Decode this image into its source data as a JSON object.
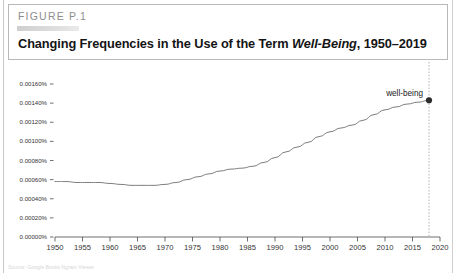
{
  "figure": {
    "number_label": "FIGURE P.1",
    "title_prefix": "Changing Frequencies in the Use of the Term ",
    "title_term": "Well-Being",
    "title_suffix": ", 1950–2019",
    "redaction_present": true
  },
  "source_note": "Source: Google Books Ngram Viewer",
  "colors": {
    "line": "#6e6e6e",
    "marker": "#2b2b2b",
    "axis": "#4a4a4a",
    "tick_text": "#333333",
    "guide_line": "#9a9a9a",
    "header_border": "#b9b9b9",
    "figure_number_text": "#8d8d8d"
  },
  "chart_data": {
    "type": "line",
    "title": "Changing Frequencies in the Use of the Term Well-Being, 1950–2019",
    "xlabel": "",
    "ylabel": "",
    "xlim": [
      1950,
      2020
    ],
    "ylim": [
      0.0,
      0.0016
    ],
    "grid": false,
    "legend": false,
    "annotations": [
      {
        "text": "well-being",
        "x": 2018,
        "y": 0.00143,
        "marker": true
      }
    ],
    "guide": {
      "type": "vertical-dotted",
      "x": 2018
    },
    "xticks": [
      1950,
      1955,
      1960,
      1965,
      1970,
      1975,
      1980,
      1985,
      1990,
      1995,
      2000,
      2005,
      2010,
      2015,
      2020
    ],
    "xtick_labels": [
      "1950",
      "1955",
      "1960",
      "1965",
      "1970",
      "1975",
      "1980",
      "1985",
      "1990",
      "1995",
      "2000",
      "2005",
      "2010",
      "2015",
      "2020"
    ],
    "yticks": [
      0.0,
      0.0002,
      0.0004,
      0.0006,
      0.0008,
      0.001,
      0.0012,
      0.0014,
      0.0016
    ],
    "ytick_labels": [
      "0.00000%",
      "0.00020%",
      "0.00040%",
      "0.00060%",
      "0.00080%",
      "0.00100%",
      "0.00120%",
      "0.00140%",
      "0.00160%"
    ],
    "series": [
      {
        "name": "well-being",
        "x": [
          1950,
          1952,
          1954,
          1956,
          1958,
          1960,
          1962,
          1964,
          1966,
          1968,
          1970,
          1972,
          1974,
          1976,
          1978,
          1980,
          1982,
          1984,
          1986,
          1988,
          1990,
          1992,
          1994,
          1996,
          1998,
          2000,
          2002,
          2004,
          2006,
          2008,
          2010,
          2012,
          2014,
          2016,
          2018
        ],
        "values": [
          0.00058,
          0.00058,
          0.00057,
          0.00057,
          0.00057,
          0.00056,
          0.00055,
          0.00054,
          0.00054,
          0.00054,
          0.00055,
          0.00057,
          0.0006,
          0.00063,
          0.00066,
          0.00069,
          0.00071,
          0.00072,
          0.00074,
          0.00078,
          0.00083,
          0.00089,
          0.00094,
          0.00099,
          0.00105,
          0.0011,
          0.00114,
          0.00117,
          0.00122,
          0.00128,
          0.00133,
          0.00136,
          0.00139,
          0.00141,
          0.00143
        ]
      }
    ]
  }
}
